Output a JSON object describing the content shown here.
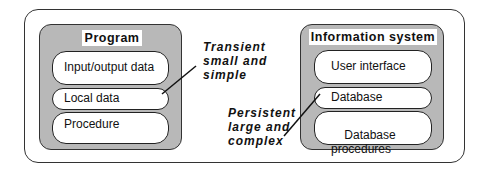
{
  "program": {
    "title": "Program",
    "items": [
      "Input/output data",
      "Local data",
      "Procedure"
    ]
  },
  "information_system": {
    "title": "Information system",
    "items": [
      "User interface",
      "Database",
      "Database\nprocedures"
    ]
  },
  "annotations": {
    "transient": [
      "Transient",
      "small and",
      "simple"
    ],
    "persistent": [
      "Persistent",
      "large and",
      "complex"
    ]
  }
}
